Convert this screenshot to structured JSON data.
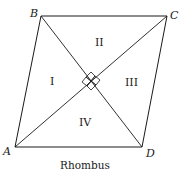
{
  "diagram": {
    "shape": "rhombus",
    "caption": "Rhombus",
    "vertices": {
      "A": {
        "label": "A",
        "x": 15,
        "y": 147
      },
      "B": {
        "label": "B",
        "x": 41,
        "y": 16
      },
      "C": {
        "label": "C",
        "x": 167,
        "y": 16
      },
      "D": {
        "label": "D",
        "x": 142,
        "y": 147
      }
    },
    "diagonals": [
      "AC",
      "BD"
    ],
    "right_angle_marker_at_center": true,
    "regions": [
      {
        "label": "I"
      },
      {
        "label": "II"
      },
      {
        "label": "III"
      },
      {
        "label": "IV"
      }
    ],
    "colors": {
      "stroke": "#1a1a1a",
      "background": "#ffffff"
    }
  }
}
